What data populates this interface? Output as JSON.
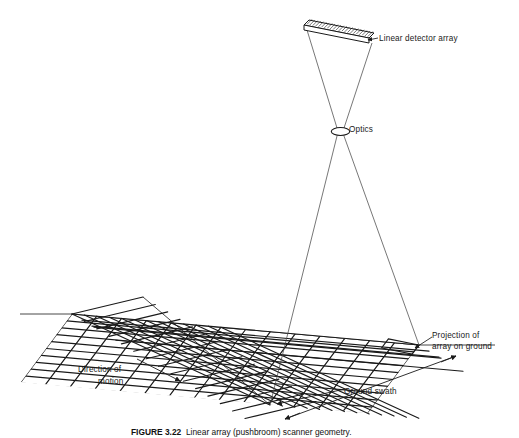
{
  "figure": {
    "domain": "technical-diagram",
    "background_color": "#ffffff",
    "line_color": "#1a1a1a",
    "caption_label": "FIGURE 3.22",
    "caption_text": "Linear array (pushbroom) scanner geometry."
  },
  "labels": {
    "linear_detector_array": "Linear detector array",
    "optics": "Optics",
    "projection_line1": "Projection of",
    "projection_line2": "array on ground",
    "direction_line1": "Direction of",
    "direction_line2": "motion",
    "ground_swath": "Ground swath"
  },
  "components": {
    "detector_array": {
      "name": "linear-detector-array",
      "description": "thin hatched slab drawn in oblique perspective",
      "element_hatch_count": 22
    },
    "optics": {
      "name": "optics-lens",
      "description": "small ellipse at ray crossing point"
    },
    "ground_plane": {
      "name": "ground-grid",
      "rows": 10,
      "columns": 14,
      "description": "perspective parallelogram grid representing terrain"
    },
    "projection_strip": {
      "name": "array-projection-strip",
      "description": "narrow parallelogram footprint of detector array on ground"
    },
    "ray_bundle": {
      "name": "optical-ray-bundle",
      "description": "rays from array ends converging at optics then diverging to ground"
    }
  },
  "annotations": {
    "direction_of_motion_arrow": "arrow pointing down-right along platform track",
    "ground_swath_dimension": "double arrow spanning swath width",
    "projection_leader": "leader line with arrowhead to projection strip"
  }
}
